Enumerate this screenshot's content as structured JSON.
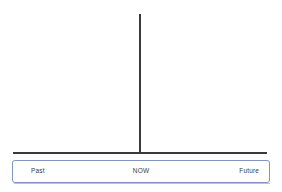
{
  "diagram": {
    "type": "timeline",
    "background_color": "#ffffff",
    "axis": {
      "line_color": "#3a3a3a",
      "horizontal": {
        "x_start": 13,
        "x_end": 267,
        "y": 153,
        "thickness": 2
      },
      "vertical": {
        "x": 140,
        "y_start": 14,
        "y_end": 154,
        "thickness": 2
      }
    },
    "label_bar": {
      "border_color": "#8094c0",
      "fill_color": "#ffffff",
      "labels": {
        "past": "Past",
        "now": "NOW",
        "future": "Future"
      }
    }
  }
}
